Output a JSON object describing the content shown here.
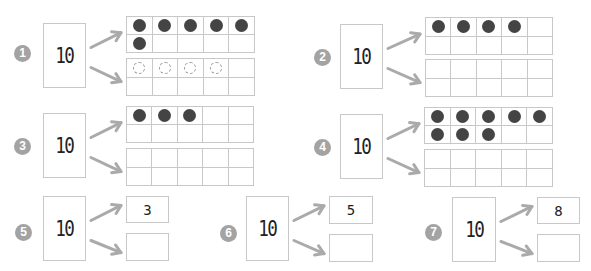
{
  "colors": {
    "badge": "#a3a3a3",
    "dot": "#444444",
    "grid": "#c8c8c8",
    "arrow": "#aaaaaa"
  },
  "problems": [
    {
      "number": "1",
      "whole": "10",
      "type": "ten-frames",
      "top_frame": {
        "filled": 6,
        "dashed": 0
      },
      "bottom_frame": {
        "filled": 0,
        "dashed": 4
      }
    },
    {
      "number": "2",
      "whole": "10",
      "type": "ten-frames",
      "top_frame": {
        "filled": 4,
        "dashed": 0
      },
      "bottom_frame": {
        "filled": 0,
        "dashed": 0
      }
    },
    {
      "number": "3",
      "whole": "10",
      "type": "ten-frames",
      "top_frame": {
        "filled": 3,
        "dashed": 0
      },
      "bottom_frame": {
        "filled": 0,
        "dashed": 0
      }
    },
    {
      "number": "4",
      "whole": "10",
      "type": "ten-frames",
      "top_frame": {
        "filled": 8,
        "dashed": 0
      },
      "bottom_frame": {
        "filled": 0,
        "dashed": 0
      }
    },
    {
      "number": "5",
      "whole": "10",
      "type": "number-bond",
      "part_top": "3",
      "part_bottom": ""
    },
    {
      "number": "6",
      "whole": "10",
      "type": "number-bond",
      "part_top": "5",
      "part_bottom": ""
    },
    {
      "number": "7",
      "whole": "10",
      "type": "number-bond",
      "part_top": "8",
      "part_bottom": ""
    }
  ]
}
